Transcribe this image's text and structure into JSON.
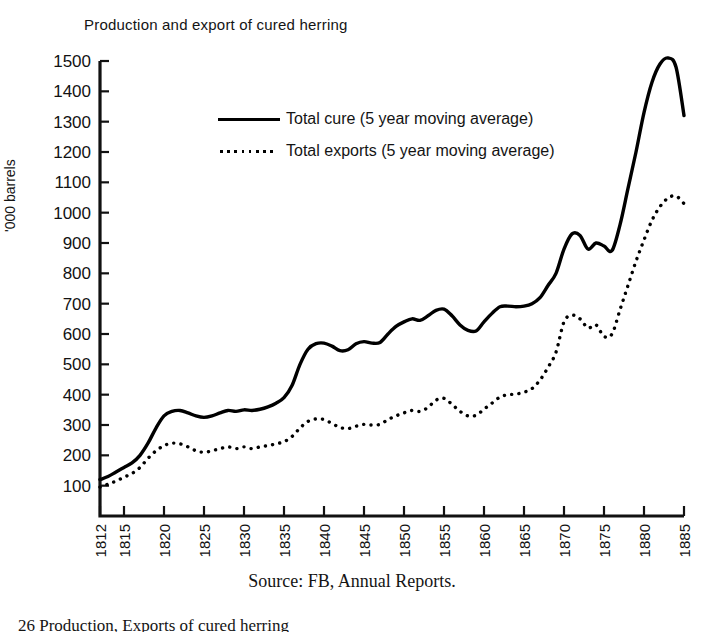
{
  "figure": {
    "title": "Production and export of cured herring",
    "source_note": "Source: FB, Annual Reports.",
    "caption": "26 Production, Exports of cured herring"
  },
  "legend": {
    "position": "inside-top-left",
    "entries": [
      {
        "key": "total_cure",
        "marker": "solid-line",
        "label": "Total cure (5 year moving average)"
      },
      {
        "key": "total_exports",
        "marker": "dotted-line",
        "label": "Total exports (5 year moving average)"
      }
    ]
  },
  "chart_data": {
    "type": "line",
    "title": "Production and export of cured herring",
    "xlabel": "",
    "ylabel": "'000 barrels",
    "xlim": [
      1812,
      1885
    ],
    "ylim": [
      0,
      1500
    ],
    "grid": false,
    "y_ticks": [
      100,
      200,
      300,
      400,
      500,
      600,
      700,
      800,
      900,
      1000,
      1100,
      1200,
      1300,
      1400,
      1500
    ],
    "x_ticks": [
      1812,
      1815,
      1820,
      1825,
      1830,
      1835,
      1840,
      1845,
      1850,
      1855,
      1860,
      1865,
      1870,
      1875,
      1880,
      1885
    ],
    "x": [
      1812,
      1813,
      1814,
      1815,
      1816,
      1817,
      1818,
      1819,
      1820,
      1821,
      1822,
      1823,
      1824,
      1825,
      1826,
      1827,
      1828,
      1829,
      1830,
      1831,
      1832,
      1833,
      1834,
      1835,
      1836,
      1837,
      1838,
      1839,
      1840,
      1841,
      1842,
      1843,
      1844,
      1845,
      1846,
      1847,
      1848,
      1849,
      1850,
      1851,
      1852,
      1853,
      1854,
      1855,
      1856,
      1857,
      1858,
      1859,
      1860,
      1861,
      1862,
      1863,
      1864,
      1865,
      1866,
      1867,
      1868,
      1869,
      1870,
      1871,
      1872,
      1873,
      1874,
      1875,
      1876,
      1877,
      1878,
      1879,
      1880,
      1881,
      1882,
      1883,
      1884,
      1885
    ],
    "series": [
      {
        "name": "Total cure (5 year moving average)",
        "style": "solid",
        "color": "#000000",
        "values": [
          120,
          130,
          145,
          160,
          175,
          200,
          240,
          290,
          330,
          345,
          348,
          340,
          330,
          325,
          330,
          340,
          348,
          345,
          350,
          348,
          352,
          360,
          372,
          390,
          430,
          500,
          550,
          568,
          570,
          560,
          545,
          548,
          568,
          575,
          570,
          572,
          600,
          625,
          640,
          650,
          645,
          660,
          678,
          682,
          660,
          630,
          612,
          610,
          640,
          668,
          690,
          692,
          690,
          692,
          700,
          720,
          760,
          800,
          880,
          930,
          925,
          880,
          900,
          890,
          875,
          960,
          1080,
          1200,
          1330,
          1430,
          1490,
          1510,
          1480,
          1320
        ]
      },
      {
        "name": "Total exports (5 year moving average)",
        "style": "dotted",
        "color": "#000000",
        "values": [
          95,
          105,
          115,
          128,
          140,
          160,
          190,
          215,
          232,
          240,
          238,
          228,
          215,
          210,
          215,
          222,
          228,
          222,
          228,
          222,
          228,
          232,
          238,
          245,
          262,
          290,
          312,
          320,
          318,
          305,
          292,
          288,
          296,
          302,
          300,
          302,
          318,
          330,
          340,
          348,
          345,
          358,
          382,
          388,
          368,
          345,
          330,
          332,
          352,
          372,
          392,
          400,
          402,
          408,
          420,
          448,
          490,
          540,
          640,
          662,
          650,
          620,
          630,
          592,
          600,
          680,
          760,
          840,
          910,
          975,
          1020,
          1048,
          1055,
          1030
        ]
      }
    ]
  }
}
